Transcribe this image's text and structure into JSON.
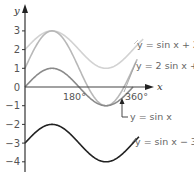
{
  "chart_data": {
    "type": "line",
    "title": "",
    "xlabel": "x",
    "ylabel": "y",
    "x_unit": "degrees",
    "xlim": [
      0,
      380
    ],
    "ylim": [
      -4.4,
      3.7
    ],
    "grid": false,
    "x_ticks": [
      {
        "value": 180,
        "label": "180°"
      },
      {
        "value": 360,
        "label": "360°"
      }
    ],
    "y_ticks": [
      {
        "value": 3,
        "label": "3"
      },
      {
        "value": 2,
        "label": "2"
      },
      {
        "value": 1,
        "label": "1"
      },
      {
        "value": 0,
        "label": "0"
      },
      {
        "value": -1,
        "label": "−1"
      },
      {
        "value": -2,
        "label": "−2"
      },
      {
        "value": -3,
        "label": "−3"
      },
      {
        "value": -4,
        "label": "−4"
      }
    ],
    "series": [
      {
        "name": "y = sin x + 2",
        "amplitude": 1,
        "shift": 2,
        "x_range": [
          0,
          395
        ],
        "color": "#d2d2d2",
        "label": "y = sin x + 2"
      },
      {
        "name": "y = 2 sin x + 1",
        "amplitude": 2,
        "shift": 1,
        "x_range": [
          0,
          375
        ],
        "color": "#b8b8b8",
        "label": "y = 2 sin x +"
      },
      {
        "name": "y = sin x",
        "amplitude": 1,
        "shift": 0,
        "x_range": [
          0,
          360
        ],
        "color": "#8a8a8a",
        "label": "y = sin x"
      },
      {
        "name": "y = sin x − 3",
        "amplitude": 1,
        "shift": -3,
        "x_range": [
          0,
          380
        ],
        "color": "#222222",
        "label": "y = sin x − 3"
      }
    ]
  }
}
